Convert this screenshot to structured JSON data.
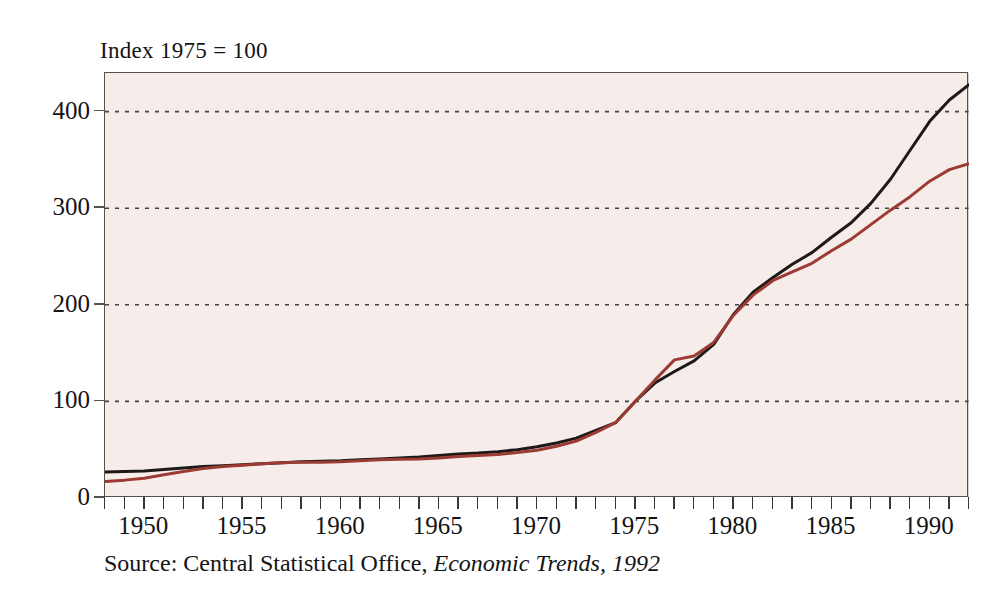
{
  "figure": {
    "index_note": "Index 1975 = 100",
    "source_caption_plain": "Source: Central Statistical Office,",
    "source_caption_italic": "Economic Trends, 1992"
  },
  "chart_data": {
    "type": "line",
    "title": "Index 1975 = 100",
    "subtitle": "",
    "xlabel": "",
    "ylabel": "",
    "xlim": [
      1948,
      1992
    ],
    "ylim": [
      0,
      440
    ],
    "yticks": [
      0,
      100,
      200,
      300,
      400
    ],
    "ytick_labels": [
      "0",
      "100",
      "200",
      "300",
      "400"
    ],
    "xticks": [
      1950,
      1955,
      1960,
      1965,
      1970,
      1975,
      1980,
      1985,
      1990
    ],
    "xtick_labels": [
      "1950",
      "1955",
      "1960",
      "1965",
      "1970",
      "1975",
      "1980",
      "1985",
      "1990"
    ],
    "x_minor_tick_interval": 1,
    "grid": "horizontal-dotted",
    "legend": "none",
    "plot_background": "#f6ece9",
    "frame_color": "#55514f",
    "gridline_color": "#45413f",
    "annotations": [
      "Index 1975 = 100",
      "Source: Central Statistical Office, Economic Trends, 1992"
    ],
    "x": [
      1948,
      1949,
      1950,
      1951,
      1952,
      1953,
      1954,
      1955,
      1956,
      1957,
      1958,
      1959,
      1960,
      1961,
      1962,
      1963,
      1964,
      1965,
      1966,
      1967,
      1968,
      1969,
      1970,
      1971,
      1972,
      1973,
      1974,
      1975,
      1976,
      1977,
      1978,
      1979,
      1980,
      1981,
      1982,
      1983,
      1984,
      1985,
      1986,
      1987,
      1988,
      1989,
      1990,
      1991,
      1992
    ],
    "series": [
      {
        "name": "black-series",
        "color": "#1c1a19",
        "values": [
          27,
          27.5,
          28,
          29.5,
          31,
          32.5,
          33.5,
          34.5,
          35.5,
          36.5,
          37.5,
          38,
          38.5,
          39.5,
          40.5,
          41.5,
          42.5,
          44,
          45.5,
          46.5,
          48,
          50,
          53,
          57,
          62,
          70,
          78,
          100,
          119,
          131,
          142,
          159,
          190,
          213,
          228,
          242,
          254,
          270,
          285,
          305,
          330,
          360,
          390,
          412,
          428
        ]
      },
      {
        "name": "red-series",
        "color": "#9b3b33",
        "values": [
          17,
          18.5,
          20.5,
          24,
          27.5,
          30.5,
          32.5,
          34,
          35.5,
          36.5,
          37,
          37,
          37.5,
          38.5,
          39.5,
          40,
          40.5,
          41.5,
          43,
          44,
          45,
          47,
          49.5,
          53.5,
          59,
          68,
          78,
          100,
          122,
          143,
          147,
          161,
          189,
          210,
          225,
          234,
          243,
          256,
          268,
          283,
          298,
          312,
          328,
          340,
          346
        ]
      }
    ]
  }
}
